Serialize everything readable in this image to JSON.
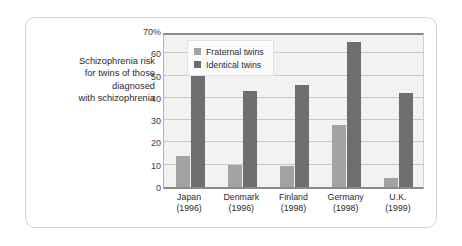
{
  "caption": {
    "lines": [
      "Schizophrenia risk",
      "for twins of those",
      "diagnosed",
      "with schizophrenia"
    ]
  },
  "chart_data": {
    "type": "bar",
    "title": "",
    "xlabel": "",
    "ylabel": "",
    "ylim": [
      0,
      70
    ],
    "yticks": [
      "0",
      "10",
      "20",
      "30",
      "40",
      "50",
      "60",
      "70%"
    ],
    "ytick_values": [
      0,
      10,
      20,
      30,
      40,
      50,
      60,
      70
    ],
    "grid": true,
    "legend_position": "top-left-inside",
    "categories": [
      "Japan\n(1996)",
      "Denmark\n(1996)",
      "Finland\n(1998)",
      "Germany\n(1998)",
      "U.K.\n(1999)"
    ],
    "category_labels": [
      {
        "name": "Japan",
        "year": "(1996)"
      },
      {
        "name": "Denmark",
        "year": "(1996)"
      },
      {
        "name": "Finland",
        "year": "(1998)"
      },
      {
        "name": "Germany",
        "year": "(1998)"
      },
      {
        "name": "U.K.",
        "year": "(1999)"
      }
    ],
    "series": [
      {
        "name": "Fraternal twins",
        "color": "#a3a3a3",
        "values": [
          14,
          10,
          9.5,
          28,
          4
        ]
      },
      {
        "name": "Identical twins",
        "color": "#6e6e6e",
        "values": [
          50,
          43,
          46,
          65,
          42
        ]
      }
    ]
  },
  "colors": {
    "fraternal": "#a3a3a3",
    "identical": "#6e6e6e",
    "plot_background": "#f2f2f2",
    "gridline": "#c9c9c9",
    "axis": "#8a8a8a",
    "card_border": "#d2d2d2"
  }
}
